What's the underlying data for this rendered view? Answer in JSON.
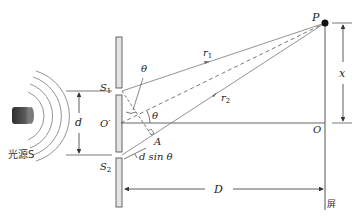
{
  "labels": {
    "P": "P",
    "r1": "r",
    "r1_sub": "1",
    "r2": "r",
    "r2_sub": "2",
    "S1": "S",
    "S1_sub": "1",
    "S2": "S",
    "S2_sub": "2",
    "theta_top": "θ",
    "theta_mid": "θ",
    "O_prime": "O′",
    "O": "O",
    "A": "A",
    "d": "d",
    "dsin": "d sin θ",
    "x": "x",
    "D": "D",
    "source": "光源S",
    "screen": "屏"
  },
  "colors": {
    "line": "#555555",
    "barrier_fill": "#e4e4e4",
    "source_dark": "#3a3a3a",
    "source_light": "#8a8a8a",
    "text": "#222222"
  }
}
